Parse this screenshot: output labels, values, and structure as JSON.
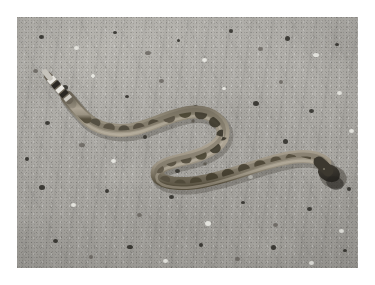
{
  "image": {
    "title": "Rattlesnake on sandy ground",
    "subject": "rattlesnake",
    "scene": "desert dirt road / sandy gravel ground",
    "orientation": "landscape",
    "border_color": "#ffffff",
    "photo": {
      "x": 17,
      "y": 17,
      "width": 341,
      "height": 251
    },
    "alt_text": "A light brown blotched rattlesnake lying in an S-curve on gray sandy gravel ground, its banded rattle at the upper left and its dark head at the lower right."
  },
  "palette": {
    "sand_light": "#bcbab5",
    "sand_mid": "#a9a7a2",
    "sand_dark": "#928f8a",
    "snake_body_light": "#b3aa99",
    "snake_body_mid": "#97907f",
    "snake_blotch": "#5d5649",
    "snake_dark": "#3a352c",
    "rattle_white": "#e8e6e0",
    "rattle_black": "#2a2722",
    "shadow": "#4a463e"
  },
  "subject_parts": [
    {
      "name": "rattle",
      "label": "Banded rattle / tail tip",
      "position": "upper-left"
    },
    {
      "name": "body",
      "label": "Blotched S-curved body",
      "position": "center"
    },
    {
      "name": "head",
      "label": "Head",
      "position": "lower-right"
    },
    {
      "name": "cast-shadow",
      "label": "Cast shadow under head",
      "position": "lower-right"
    }
  ]
}
